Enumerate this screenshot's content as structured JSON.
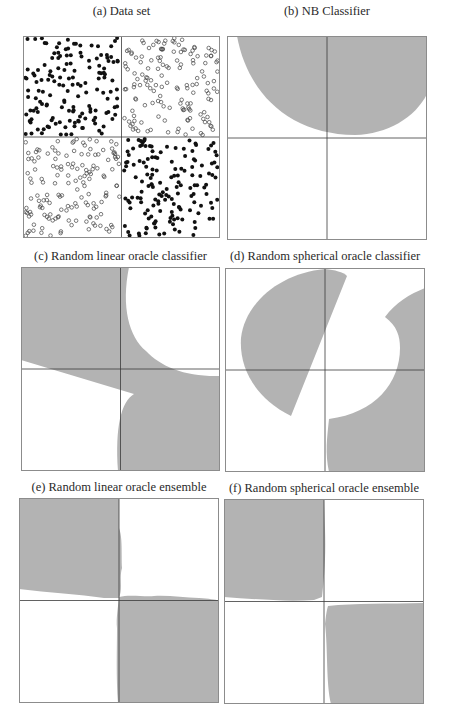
{
  "figure": {
    "width": 449,
    "height": 716,
    "colors": {
      "region_fill": "#b3b3b3",
      "frame": "#8c8c8c",
      "axis_line": "#3a3a3a",
      "dot_filled": "#111111",
      "dot_open_stroke": "#444444"
    }
  },
  "chart_data": [
    {
      "id": "a",
      "type": "scatter",
      "title": "(a) Data set",
      "description": "Checkerboard (XOR) data: filled dots in top-left and bottom-right quadrants, open circles in top-right and bottom-left quadrants",
      "xlim": [
        0,
        1
      ],
      "ylim": [
        0,
        1
      ],
      "quadrant_split": [
        0.5,
        0.5
      ],
      "series": [
        {
          "name": "class 1 (filled)",
          "marker": "filled",
          "quadrants": [
            "top-left",
            "bottom-right"
          ],
          "approx_points_per_quadrant": 150
        },
        {
          "name": "class 2 (open)",
          "marker": "open",
          "quadrants": [
            "top-right",
            "bottom-left"
          ],
          "approx_points_per_quadrant": 150
        }
      ]
    },
    {
      "id": "b",
      "type": "area",
      "title": "(b) NB Classifier",
      "description": "Single elliptical gray region covering top of plot, bottom edge near the horizontal midline",
      "xlim": [
        0,
        1
      ],
      "ylim": [
        0,
        1
      ]
    },
    {
      "id": "c",
      "type": "area",
      "title": "(c) Random linear oracle classifier",
      "description": "Two curved regions split by a linear oracle boundary",
      "xlim": [
        0,
        1
      ],
      "ylim": [
        0,
        1
      ]
    },
    {
      "id": "d",
      "type": "area",
      "title": "(d) Random spherical oracle classifier",
      "description": "Half-disc region in upper-left and concave region in lower-right",
      "xlim": [
        0,
        1
      ],
      "ylim": [
        0,
        1
      ]
    },
    {
      "id": "e",
      "type": "area",
      "title": "(e) Random linear oracle ensemble",
      "description": "Gray in top-left and bottom-right quadrants (checkerboard recovered)",
      "xlim": [
        0,
        1
      ],
      "ylim": [
        0,
        1
      ]
    },
    {
      "id": "f",
      "type": "area",
      "title": "(f) Random spherical oracle ensemble",
      "description": "Gray in top-left and bottom-right quadrants (checkerboard recovered)",
      "xlim": [
        0,
        1
      ],
      "ylim": [
        0,
        1
      ]
    }
  ],
  "panels": [
    {
      "id": "a",
      "title": "(a) Data set",
      "title_y": 4,
      "box": [
        23,
        36,
        197,
        202
      ],
      "kind": "scatter",
      "seed": 7,
      "n_per_quadrant": 150
    },
    {
      "id": "b",
      "title": "(b) NB Classifier",
      "title_y": 4,
      "box": [
        227,
        36,
        200,
        204
      ],
      "kind": "regions",
      "paths": [
        "M 10 0 C 20 55 60 98 128 99 C 160 98 188 82 200 58 L 200 0 Z"
      ]
    },
    {
      "id": "c",
      "title": "(c) Random linear oracle classifier",
      "title_y": 249,
      "box": [
        21,
        267,
        199,
        204
      ],
      "kind": "regions",
      "paths": [
        "M 0 0 L 108 0 C 100 40 108 70 125 84 C 140 100 165 110 199 109 L 199 204 L 97 204 C 94 160 100 135 113 127 L 0 93 Z",
        "M 0 93 L 0 100 L 0 93 Z"
      ]
    },
    {
      "id": "d",
      "title": "(d) Random spherical oracle classifier",
      "title_y": 249,
      "box": [
        225,
        268,
        200,
        204
      ],
      "kind": "regions",
      "paths": [
        "M 100 1 C 110 2 118 4 122 8 L 66 148 C 30 130 14 100 16 70 C 20 35 55 5 100 1 Z",
        "M 200 20 L 200 204 L 104 204 C 100 185 102 170 104 151 C 150 145 175 115 175 80 C 175 68 172 58 160 49 C 170 35 185 26 200 20 Z"
      ]
    },
    {
      "id": "e",
      "title": "(e) Random linear oracle ensemble",
      "title_y": 480,
      "box": [
        19,
        498,
        200,
        205
      ],
      "kind": "regions",
      "paths": [
        "M 0 0 L 100 0 L 100 30 C 104 40 102 60 103 70 C 100 80 104 90 100 100 L 85 100 C 60 96 30 95 0 91 Z",
        "M 100 99 C 110 96 125 99 135 98 C 150 97 165 100 180 100 C 190 101 196 101 200 103 L 200 205 L 99 205 C 97 180 98 150 98 130 C 97 120 99 110 100 99 Z"
      ]
    },
    {
      "id": "f",
      "title": "(f) Random spherical oracle ensemble",
      "title_y": 481,
      "box": [
        224,
        499,
        200,
        205
      ],
      "kind": "regions",
      "paths": [
        "M 0 0 L 100 0 L 101 30 C 102 60 100 80 98 98 L 90 101 C 60 103 30 100 0 98 Z",
        "M 104 107 C 130 104 165 105 200 104 L 200 205 L 107 205 C 102 185 104 150 101 125 C 102 115 103 110 104 107 Z"
      ]
    }
  ]
}
